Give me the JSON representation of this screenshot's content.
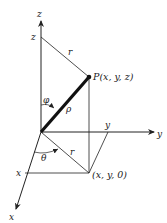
{
  "diagram": {
    "type": "spherical-coordinates",
    "axes": {
      "z": {
        "label": "z",
        "tick_label": "z"
      },
      "y": {
        "label": "y",
        "tick_label": "y"
      },
      "x": {
        "label": "x",
        "tick_label": "x"
      }
    },
    "point": {
      "label": "P(x, y, z)"
    },
    "projection": {
      "label": "(x, y, 0)"
    },
    "segments": {
      "rho": "ρ",
      "r_top": "r",
      "r_bottom": "r"
    },
    "angles": {
      "phi": "φ",
      "theta": "θ"
    },
    "colors": {
      "line": "#222222",
      "background": "#ffffff"
    }
  }
}
